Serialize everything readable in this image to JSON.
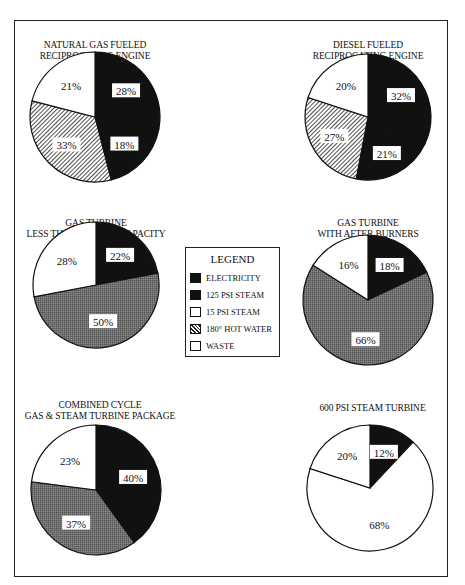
{
  "legend": {
    "title": "LEGEND",
    "items": [
      {
        "label": "ELECTRICITY",
        "pattern": "solid-black"
      },
      {
        "label": "125 PSI STEAM",
        "pattern": "solid-black"
      },
      {
        "label": "15 PSI STEAM",
        "pattern": "white"
      },
      {
        "label": "180° HOT WATER",
        "pattern": "diagonal-hatch"
      },
      {
        "label": "WASTE",
        "pattern": "white"
      }
    ]
  },
  "charts": {
    "c1": {
      "title": "NATURAL GAS FUELED\nRECIPROCATING ENGINE"
    },
    "c2": {
      "title": "DIESEL FUELED\nRECIPROCATING ENGINE"
    },
    "c3": {
      "title": "GAS TURBINE\nLESS THAN 2,000 KW CAPACITY"
    },
    "c4": {
      "title": "GAS TURBINE\nWITH AFTER BURNERS"
    },
    "c5": {
      "title": "COMBINED CYCLE\nGAS & STEAM TURBINE PACKAGE"
    },
    "c6": {
      "title": "600 PSI STEAM TURBINE"
    }
  },
  "chart_data": [
    {
      "type": "pie",
      "title": "NATURAL GAS FUELED RECIPROCATING ENGINE",
      "categories": [
        "Electricity",
        "125 PSI Steam",
        "180° Hot Water",
        "Waste"
      ],
      "values": [
        28,
        18,
        33,
        21
      ],
      "labels": [
        "28%",
        "18%",
        "33%",
        "21%"
      ]
    },
    {
      "type": "pie",
      "title": "DIESEL FUELED RECIPROCATING ENGINE",
      "categories": [
        "Electricity",
        "125 PSI Steam",
        "180° Hot Water",
        "Waste"
      ],
      "values": [
        32,
        21,
        27,
        20
      ],
      "labels": [
        "32%",
        "21%",
        "27%",
        "20%"
      ]
    },
    {
      "type": "pie",
      "title": "GAS TURBINE LESS THAN 2,000 KW CAPACITY",
      "categories": [
        "Electricity",
        "125 PSI Steam",
        "Waste"
      ],
      "values": [
        22,
        50,
        28
      ],
      "labels": [
        "22%",
        "50%",
        "28%"
      ]
    },
    {
      "type": "pie",
      "title": "GAS TURBINE WITH AFTER BURNERS",
      "categories": [
        "Electricity",
        "125 PSI Steam",
        "Waste"
      ],
      "values": [
        18,
        66,
        16
      ],
      "labels": [
        "18%",
        "66%",
        "16%"
      ]
    },
    {
      "type": "pie",
      "title": "COMBINED CYCLE GAS & STEAM TURBINE PACKAGE",
      "categories": [
        "Electricity",
        "125 PSI Steam",
        "Waste"
      ],
      "values": [
        40,
        37,
        23
      ],
      "labels": [
        "40%",
        "37%",
        "23%"
      ]
    },
    {
      "type": "pie",
      "title": "600 PSI STEAM TURBINE",
      "categories": [
        "Electricity",
        "15 PSI Steam",
        "Waste"
      ],
      "values": [
        12,
        68,
        20
      ],
      "labels": [
        "12%",
        "68%",
        "20%"
      ]
    }
  ]
}
